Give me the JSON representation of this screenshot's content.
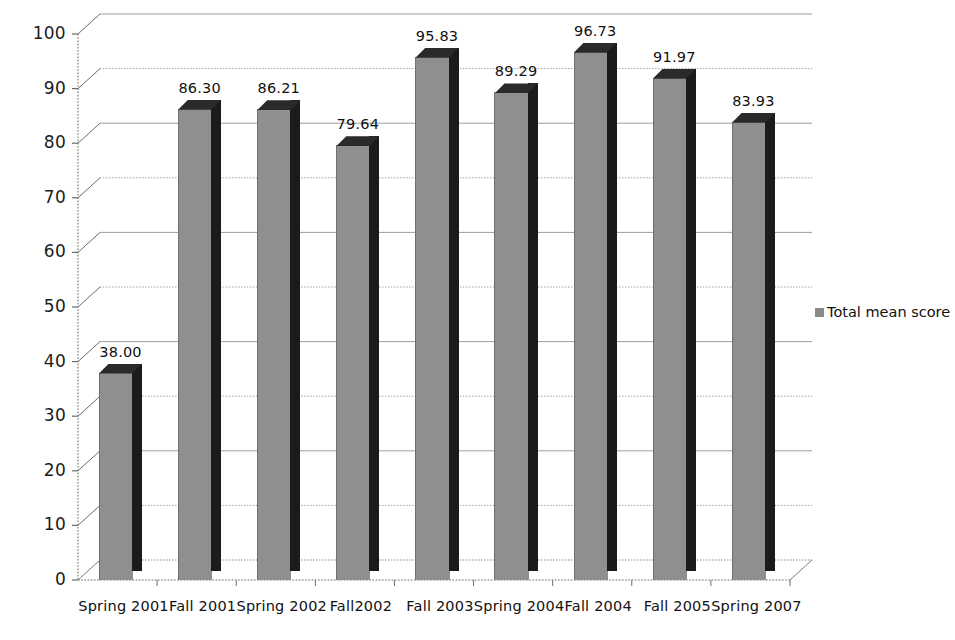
{
  "chart_data": {
    "type": "bar",
    "title": "",
    "subtitle": "",
    "xlabel": "",
    "ylabel": "",
    "ylim": [
      0,
      100
    ],
    "ytick_step": 10,
    "yticks": [
      "0",
      "10",
      "20",
      "30",
      "40",
      "50",
      "60",
      "70",
      "80",
      "90",
      "100"
    ],
    "grid": true,
    "legend_position": "right",
    "style": "3d-column",
    "categories": [
      "Spring 2001",
      "Fall 2001",
      "Spring 2002",
      "Fall2002",
      "Fall 2003",
      "Spring 2004",
      "Fall 2004",
      "Fall 2005",
      "Spring 2007"
    ],
    "series": [
      {
        "name": "Total mean score",
        "color": "#8f8f8f",
        "values": [
          38.0,
          86.3,
          86.21,
          79.64,
          95.83,
          89.29,
          96.73,
          91.97,
          83.93
        ],
        "data_labels": [
          "38.00",
          "86.30",
          "86.21",
          "79.64",
          "95.83",
          "89.29",
          "96.73",
          "91.97",
          "83.93"
        ]
      }
    ]
  },
  "legend": {
    "marker_name": "legend-swatch-total-mean-score",
    "entries": [
      {
        "label": "Total mean score",
        "color": "#8a8a8a"
      }
    ]
  },
  "colors": {
    "bar_front": "#8f8f8f",
    "bar_side": "#1b1b1b",
    "bar_top": "#2a2a2a",
    "axis": "#6b6b6b",
    "grid": "#9a9a9a",
    "text": "#111111",
    "background": "#ffffff"
  }
}
